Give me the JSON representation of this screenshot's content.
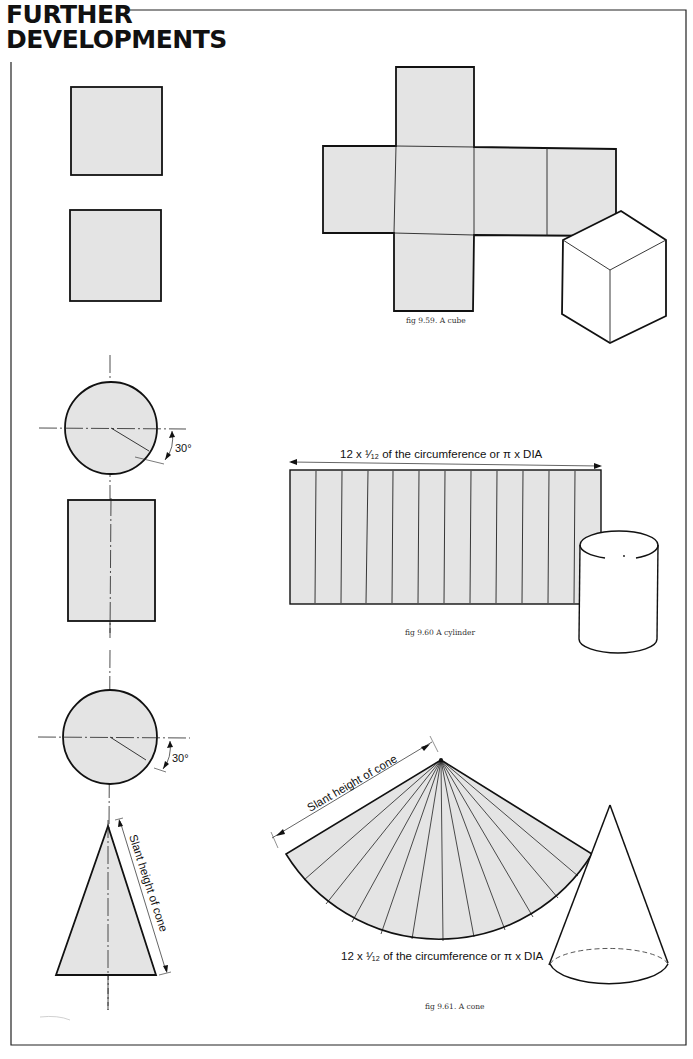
{
  "page": {
    "title_line1": "FURTHER",
    "title_line2": "DEVELOPMENTS"
  },
  "colors": {
    "fill": "#e4e4e4",
    "line": "#111111",
    "background": "#ffffff"
  },
  "figures": {
    "cube": {
      "caption": "fig 9.59. A cube"
    },
    "cylinder": {
      "caption": "fig 9.60 A cylinder",
      "dimension_label": "12 x ¹⁄₁₂ of the circumference or π x DIA",
      "angle_label": "30°",
      "divisions": 12
    },
    "cone": {
      "caption": "fig 9.61. A cone",
      "arc_label": "12 x ¹⁄₁₂ of the circumference or π x DIA",
      "slant_label": "Slant height of cone",
      "side_slant_label": "Slant height of cone",
      "angle_label": "30°",
      "divisions": 12
    }
  }
}
